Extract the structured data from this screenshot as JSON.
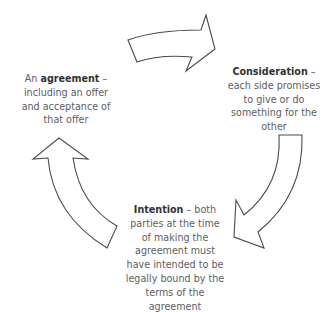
{
  "diagram": {
    "type": "cycle",
    "stroke_color": "#4a4a4a",
    "fill_color": "#ffffff",
    "nodes": [
      {
        "id": "agreement",
        "term": "agreement",
        "lines": [
          "An",
          "agreement",
          " –",
          "including an offer",
          "and acceptance of",
          "that offer"
        ]
      },
      {
        "id": "consideration",
        "term": "Consideration",
        "lines": [
          "Consideration",
          " –",
          "each side promises",
          "to give or do",
          "something for the",
          "other"
        ]
      },
      {
        "id": "intention",
        "term": "Intention",
        "lines": [
          "Intention",
          " – both",
          "parties at the time",
          "of making the",
          "agreement must",
          "have intended to be",
          "legally bound by the",
          "terms of the",
          "agreement"
        ]
      }
    ],
    "arrows": [
      {
        "from": "agreement",
        "to": "consideration",
        "direction": "clockwise"
      },
      {
        "from": "consideration",
        "to": "intention",
        "direction": "clockwise"
      },
      {
        "from": "intention",
        "to": "agreement",
        "direction": "clockwise"
      }
    ]
  }
}
